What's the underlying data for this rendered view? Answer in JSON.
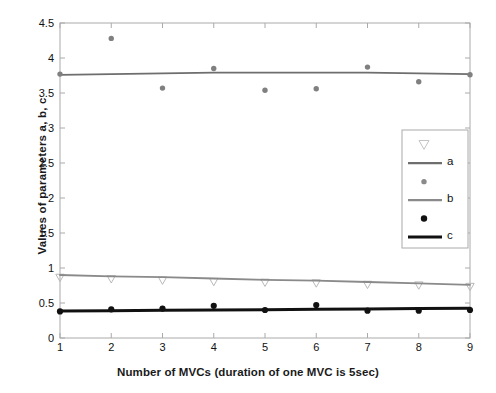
{
  "chart_data": {
    "type": "scatter",
    "title": "",
    "xlabel": "Number of MVCs (duration of one MVC is 5sec)",
    "ylabel": "Values of parameters a, b, c",
    "x": [
      1,
      2,
      3,
      4,
      5,
      6,
      7,
      8,
      9
    ],
    "xlim": [
      1,
      9
    ],
    "ylim": [
      0,
      4.5
    ],
    "xticks": [
      "1",
      "2",
      "3",
      "4",
      "5",
      "6",
      "7",
      "8",
      "9"
    ],
    "yticks": [
      "0",
      "0.5",
      "1",
      "1.5",
      "2",
      "2.5",
      "3",
      "3.5",
      "4",
      "4.5"
    ],
    "grid": false,
    "legend_position": "center-right",
    "series": [
      {
        "name": "a-markers",
        "label": "",
        "marker": "triangle-down",
        "color": "#b9b9b9",
        "style": "markers",
        "values": [
          0.86,
          0.84,
          0.82,
          0.8,
          0.79,
          0.78,
          0.76,
          0.75,
          0.73
        ]
      },
      {
        "name": "a",
        "label": "a",
        "marker": "none",
        "color": "#6e6e6e",
        "style": "line",
        "values": [
          3.76,
          3.77,
          3.78,
          3.79,
          3.79,
          3.79,
          3.79,
          3.78,
          3.77
        ]
      },
      {
        "name": "b-markers",
        "label": "",
        "marker": "circle",
        "color": "#808080",
        "style": "markers",
        "values": [
          3.77,
          4.28,
          3.57,
          3.85,
          3.54,
          3.56,
          3.87,
          3.66,
          3.76
        ]
      },
      {
        "name": "b",
        "label": "b",
        "marker": "none",
        "color": "#8a8a8a",
        "style": "line",
        "values": [
          0.9,
          0.88,
          0.87,
          0.85,
          0.83,
          0.82,
          0.8,
          0.78,
          0.76
        ]
      },
      {
        "name": "c-markers",
        "label": "",
        "marker": "filled-circle",
        "color": "#111111",
        "style": "markers",
        "values": [
          0.38,
          0.41,
          0.42,
          0.46,
          0.4,
          0.47,
          0.39,
          0.39,
          0.4
        ]
      },
      {
        "name": "c",
        "label": "c",
        "marker": "none",
        "color": "#111111",
        "style": "thick-line",
        "values": [
          0.385,
          0.39,
          0.395,
          0.4,
          0.405,
          0.41,
          0.415,
          0.42,
          0.425
        ]
      }
    ]
  },
  "legend": {
    "entries": [
      {
        "key": "tri",
        "label": "",
        "symbol": "triangle-down",
        "color": "#c4c4c4"
      },
      {
        "key": "a",
        "label": "a",
        "symbol": "line",
        "color": "#6e6e6e"
      },
      {
        "key": "dot-gray",
        "label": "",
        "symbol": "circle",
        "color": "#8a8a8a"
      },
      {
        "key": "b",
        "label": "b",
        "symbol": "line",
        "color": "#8a8a8a"
      },
      {
        "key": "dot-black",
        "label": "",
        "symbol": "filled-circle",
        "color": "#111111"
      },
      {
        "key": "c",
        "label": "c",
        "symbol": "thick-line",
        "color": "#111111"
      }
    ]
  },
  "axes": {
    "frame_color": "#aaaaaa"
  }
}
